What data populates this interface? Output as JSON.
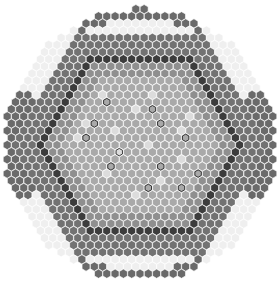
{
  "figure": {
    "type": "hexagonal core loading map",
    "width": 277,
    "height": 284
  },
  "grid": {
    "center": [
      140,
      145
    ],
    "cell_pitch_x": 8.3,
    "row_pitch_y": 7.15,
    "cell_radius": 4.6,
    "max_hex_ring": 19,
    "clip_radius": 136
  },
  "regions": [
    {
      "name": "inner-core",
      "min_ring": 0,
      "max_ring": 9,
      "fill": "#a9a9a9"
    },
    {
      "name": "middle-core",
      "min_ring": 10,
      "max_ring": 11,
      "fill": "#8f8f8f"
    },
    {
      "name": "dark-band",
      "min_ring": 12,
      "max_ring": 12,
      "fill": "#3c3c3c"
    },
    {
      "name": "outer-core",
      "min_ring": 13,
      "max_ring": 15,
      "fill": "#727272"
    },
    {
      "name": "reflector",
      "min_ring": 16,
      "max_ring": 19,
      "fill": "#efefef"
    }
  ],
  "reflector_dark_sectors": [
    {
      "from_deg": 60,
      "to_deg": 120,
      "fill": "#6a6a6a",
      "outer_only": true
    },
    {
      "from_deg": 240,
      "to_deg": 300,
      "fill": "#6a6a6a",
      "outer_only": true
    },
    {
      "from_deg": -25,
      "to_deg": 25,
      "fill": "#6a6a6a",
      "outer_only": false
    },
    {
      "from_deg": 155,
      "to_deg": 205,
      "fill": "#6a6a6a",
      "outer_only": false
    }
  ],
  "highlight_cells": {
    "fill": "#dcdcdc",
    "positions": [
      [
        -5,
        -3
      ],
      [
        2,
        -5
      ],
      [
        6,
        -2
      ],
      [
        -3,
        1
      ],
      [
        4,
        2
      ],
      [
        0,
        5
      ],
      [
        -6,
        4
      ],
      [
        7,
        5
      ],
      [
        -1,
        -7
      ],
      [
        3,
        8
      ],
      [
        -7,
        -1
      ],
      [
        5,
        -7
      ],
      [
        1,
        0
      ],
      [
        -4,
        7
      ],
      [
        8,
        -4
      ],
      [
        -2,
        -2
      ]
    ]
  },
  "marked_cells": {
    "stroke": "#2a2a2a",
    "positions": [
      [
        -1,
        -6
      ],
      [
        4,
        -5
      ],
      [
        -4,
        -3
      ],
      [
        4,
        -3
      ],
      [
        -3,
        1
      ],
      [
        6,
        -1
      ],
      [
        -5,
        3
      ],
      [
        1,
        3
      ],
      [
        5,
        4
      ],
      [
        -2,
        6
      ],
      [
        2,
        6
      ],
      [
        -6,
        -1
      ]
    ]
  },
  "cell_stroke": "#ffffff"
}
